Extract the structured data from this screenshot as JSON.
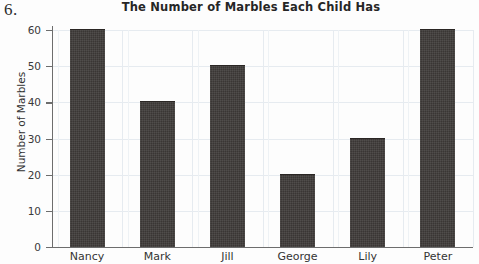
{
  "question_number": "6.",
  "chart_data": {
    "type": "bar",
    "title": "The Number of Marbles Each Child Has",
    "xlabel": "",
    "ylabel": "Number of Marbles",
    "categories": [
      "Nancy",
      "Mark",
      "Jill",
      "George",
      "Lily",
      "Peter"
    ],
    "values": [
      60,
      40,
      50,
      20,
      30,
      60
    ],
    "ylim": [
      0,
      60
    ],
    "ytick_labels": [
      "0",
      "10",
      "20",
      "30",
      "40",
      "50",
      "60"
    ],
    "ytick_values": [
      0,
      10,
      20,
      30,
      40,
      50,
      60
    ],
    "grid": true,
    "legend": false,
    "bar_color": "#3f3b39",
    "grid_color": "#e6ebf0",
    "axis_color": "#6d6d6d"
  }
}
